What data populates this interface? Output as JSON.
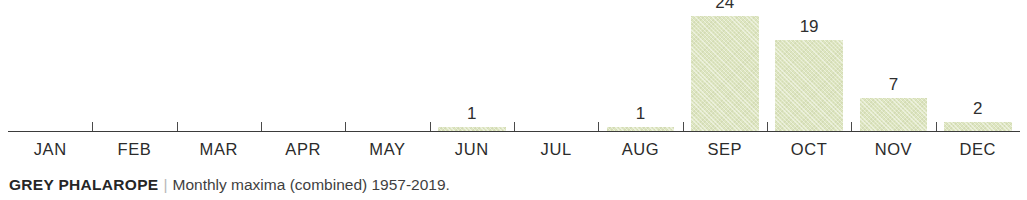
{
  "top_remnant_text": "",
  "caption": {
    "species": "GREY PHALAROPE",
    "separator": "|",
    "detail": "Monthly maxima (combined) 1957-2019."
  },
  "colors": {
    "bar_fill": "#dde5c0",
    "axis": "#3b3b3b",
    "label_text": "#2b2b2b",
    "value_text": "#2f2f2f",
    "caption_species": "#262626",
    "caption_separator": "#b8b8b8"
  },
  "chart_data": {
    "type": "bar",
    "title": "GREY PHALAROPE",
    "subtitle": "Monthly maxima (combined) 1957-2019.",
    "xlabel": "",
    "ylabel": "",
    "ylim": [
      0,
      26
    ],
    "grid": false,
    "legend": "none",
    "orientation": "vertical",
    "categories": [
      "JAN",
      "FEB",
      "MAR",
      "APR",
      "MAY",
      "JUN",
      "JUL",
      "AUG",
      "SEP",
      "OCT",
      "NOV",
      "DEC"
    ],
    "values": [
      0,
      0,
      0,
      0,
      0,
      1,
      0,
      1,
      24,
      19,
      7,
      2
    ],
    "value_labels": [
      "",
      "",
      "",
      "",
      "",
      "1",
      "",
      "1",
      "24",
      "19",
      "7",
      "2"
    ],
    "points": [
      {
        "category": "JAN",
        "value": 0,
        "label": ""
      },
      {
        "category": "FEB",
        "value": 0,
        "label": ""
      },
      {
        "category": "MAR",
        "value": 0,
        "label": ""
      },
      {
        "category": "APR",
        "value": 0,
        "label": ""
      },
      {
        "category": "MAY",
        "value": 0,
        "label": ""
      },
      {
        "category": "JUN",
        "value": 1,
        "label": "1"
      },
      {
        "category": "JUL",
        "value": 0,
        "label": ""
      },
      {
        "category": "AUG",
        "value": 1,
        "label": "1"
      },
      {
        "category": "SEP",
        "value": 24,
        "label": "24"
      },
      {
        "category": "OCT",
        "value": 19,
        "label": "19"
      },
      {
        "category": "NOV",
        "value": 7,
        "label": "7"
      },
      {
        "category": "DEC",
        "value": 2,
        "label": "2"
      }
    ]
  }
}
